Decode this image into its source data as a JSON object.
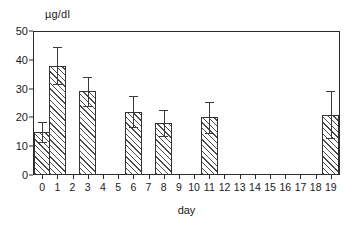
{
  "chart_data": {
    "type": "bar",
    "title": "",
    "subtitle": "",
    "xlabel": "day",
    "ylabel": "µg/dl",
    "ylim": [
      0,
      50
    ],
    "xlim": [
      -0.6,
      19.6
    ],
    "grid": false,
    "legend": null,
    "y_ticks": [
      0,
      10,
      20,
      30,
      40,
      50
    ],
    "y_tick_labels": [
      "0",
      "10",
      "20",
      "30",
      "40",
      "50"
    ],
    "x_ticks": [
      0,
      1,
      2,
      3,
      4,
      5,
      6,
      7,
      8,
      9,
      10,
      11,
      12,
      13,
      14,
      15,
      16,
      17,
      18,
      19
    ],
    "x_tick_labels": [
      "0",
      "1",
      "2",
      "3",
      "4",
      "5",
      "6",
      "7",
      "8",
      "9",
      "10",
      "11",
      "12",
      "13",
      "14",
      "15",
      "16",
      "17",
      "18",
      "19"
    ],
    "bar_style": "hatched-diagonal",
    "bar_edge_color": "#333333",
    "bar_face_color": "#ffffff",
    "bar_hatch_color": "#4a4a4a",
    "error_bar_color": "#3a3a3a",
    "axis_color": "#2b2b2b",
    "categories": [
      "0",
      "1",
      "3",
      "6",
      "8",
      "11",
      "19"
    ],
    "values": [
      15,
      38,
      29,
      22,
      18,
      20,
      21
    ],
    "errors": [
      3.5,
      6.5,
      5.0,
      5.5,
      4.5,
      5.5,
      8.0
    ],
    "bars": [
      {
        "day": 0,
        "value": 15,
        "error": 3.5
      },
      {
        "day": 1,
        "value": 38,
        "error": 6.5
      },
      {
        "day": 3,
        "value": 29,
        "error": 5.0
      },
      {
        "day": 6,
        "value": 22,
        "error": 5.5
      },
      {
        "day": 8,
        "value": 18,
        "error": 4.5
      },
      {
        "day": 11,
        "value": 20,
        "error": 5.5
      },
      {
        "day": 19,
        "value": 21,
        "error": 8.0
      }
    ],
    "missing_days": [
      2,
      4,
      5,
      7,
      9,
      10,
      12,
      13,
      14,
      15,
      16,
      17,
      18
    ]
  }
}
